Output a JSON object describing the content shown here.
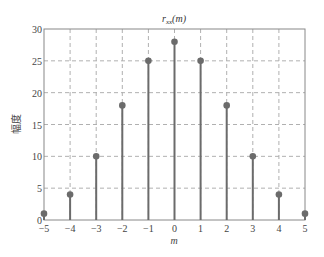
{
  "chart_data": {
    "type": "stem",
    "title_main": "r",
    "title_sub": "xx",
    "title_arg": "(m)",
    "xlabel": "m",
    "ylabel": "幅度",
    "x": [
      -5,
      -4,
      -3,
      -2,
      -1,
      0,
      1,
      2,
      3,
      4,
      5
    ],
    "values": [
      1,
      4,
      10,
      18,
      25,
      28,
      25,
      18,
      10,
      4,
      1
    ],
    "xlim": [
      -5,
      5
    ],
    "ylim": [
      0,
      30
    ],
    "xticks": [
      -5,
      -4,
      -3,
      -2,
      -1,
      0,
      1,
      2,
      3,
      4,
      5
    ],
    "yticks": [
      0,
      5,
      10,
      15,
      20,
      25,
      30
    ],
    "grid": true,
    "colors": {
      "stem": "#6b6b6b",
      "grid": "#b0b0b0",
      "axes": "#888888"
    }
  }
}
